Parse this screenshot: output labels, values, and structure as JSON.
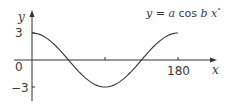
{
  "chart_data": {
    "type": "line",
    "title": "y = a cos b x°",
    "equation": {
      "y": "y",
      "eq": " = ",
      "a": "a",
      "cos": " cos ",
      "b": "b",
      "x": " x",
      "deg": "°"
    },
    "xlabel": "x",
    "ylabel": "y",
    "origin_label": "0",
    "x_ticks": [
      {
        "value": 90,
        "label": ""
      },
      {
        "value": 180,
        "label": "180"
      }
    ],
    "y_ticks": [
      {
        "value": 3,
        "label": "3"
      },
      {
        "value": -3,
        "label": "-3"
      }
    ],
    "xlim": [
      0,
      180
    ],
    "ylim": [
      -3,
      3
    ],
    "grid": false,
    "series": [
      {
        "name": "y = 3 cos 2x°",
        "x": [
          0,
          15,
          30,
          45,
          60,
          75,
          90,
          105,
          120,
          135,
          150,
          165,
          180
        ],
        "y": [
          3,
          2.6,
          1.5,
          0,
          -1.5,
          -2.6,
          -3,
          -2.6,
          -1.5,
          0,
          1.5,
          2.6,
          3
        ]
      }
    ],
    "colors": {
      "axis": "#333333",
      "curve": "#333333",
      "text": "#3a3a3a"
    }
  }
}
